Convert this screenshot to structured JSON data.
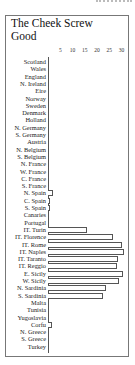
{
  "chart_data": {
    "type": "bar",
    "orientation": "horizontal",
    "title": "The Cheek Screw Good",
    "xlabel": "",
    "ylabel": "",
    "xlim": [
      0,
      32
    ],
    "xticks": [
      5,
      10,
      15,
      20,
      25,
      30
    ],
    "grid": false,
    "legend": null,
    "categories": [
      "Scotland",
      "Wales",
      "England",
      "N. Ireland",
      "Eire",
      "Norway",
      "Sweden",
      "Denmark",
      "Holland",
      "N. Germany",
      "S. Germany",
      "Austria",
      "N. Belgium",
      "S. Belgium",
      "N. France",
      "W. France",
      "C. France",
      "S. France",
      "N. Spain",
      "C. Spain",
      "S. Spain",
      "Canaries",
      "Portugal",
      "IT. Turin",
      "IT. Florence",
      "IT. Rome",
      "IT. Naples",
      "IT. Taranto",
      "IT. Reggio",
      "E. Sicily",
      "W. Sicily",
      "N. Sardinia",
      "S. Sardinia",
      "Malta",
      "Tunisia",
      "Yugoslavia",
      "Corfu",
      "N. Greece",
      "S. Greece",
      "Turkey"
    ],
    "values": [
      0,
      0,
      0,
      0,
      0,
      0,
      0,
      0,
      0,
      0,
      0,
      0,
      0,
      0,
      0,
      0,
      0,
      0,
      2,
      1,
      1,
      0,
      0,
      16,
      26.5,
      30,
      31,
      28.5,
      28,
      30.5,
      29,
      23.5,
      22.5,
      0,
      0,
      0,
      1.5,
      0,
      0,
      0
    ]
  },
  "title_line1": "The Cheek Screw",
  "title_line2": "Good"
}
